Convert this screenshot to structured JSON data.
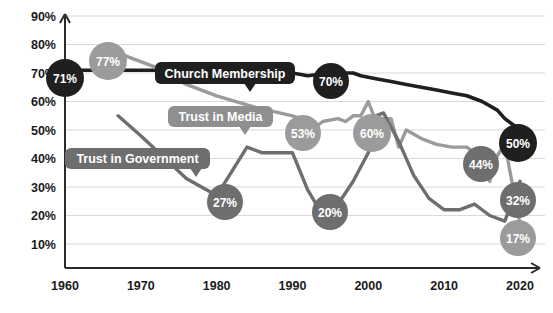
{
  "chart_data": {
    "type": "line",
    "title": "",
    "subtitle": "",
    "xlabel": "",
    "ylabel": "",
    "xlim": [
      1960,
      2020
    ],
    "ylim": [
      0,
      90
    ],
    "grid": true,
    "legend_position": "inline-callouts",
    "y_ticks": [
      "10%",
      "20%",
      "30%",
      "40%",
      "50%",
      "60%",
      "70%",
      "80%",
      "90%"
    ],
    "y_tick_values": [
      10,
      20,
      30,
      40,
      50,
      60,
      70,
      80,
      90
    ],
    "x_ticks": [
      "1960",
      "1970",
      "1980",
      "1990",
      "2000",
      "2010",
      "2020"
    ],
    "x_tick_values": [
      1960,
      1970,
      1980,
      1990,
      2000,
      2010,
      2020
    ],
    "series": [
      {
        "name": "Church Membership",
        "color": "#1f1f1f",
        "stroke_width": 3.6,
        "x": [
          1960,
          1965,
          1968,
          1972,
          1976,
          1980,
          1984,
          1987,
          1990,
          1992,
          1995,
          1998,
          1999,
          2001,
          2003,
          2005,
          2007,
          2009,
          2011,
          2013,
          2015,
          2017,
          2018,
          2020
        ],
        "values": [
          71,
          71,
          71,
          71,
          70,
          70,
          69,
          68,
          70,
          69,
          70,
          70,
          69,
          68,
          67,
          66,
          65,
          64,
          63,
          62,
          60,
          57,
          54,
          50
        ]
      },
      {
        "name": "Trust in Media",
        "color": "#9b9b9b",
        "stroke_width": 3.4,
        "x": [
          1967,
          1972,
          1974,
          1976,
          1980,
          1985,
          1990,
          1992,
          1993,
          1994,
          1996,
          1997,
          1998,
          1999,
          2000,
          2001,
          2002,
          2003,
          2004,
          2005,
          2007,
          2009,
          2011,
          2013,
          2015,
          2016,
          2017,
          2018,
          2020
        ],
        "values": [
          77,
          72,
          69,
          66,
          62,
          58,
          55,
          53,
          51,
          53,
          54,
          53,
          55,
          55,
          60,
          53,
          54,
          54,
          44,
          50,
          47,
          45,
          44,
          44,
          40,
          32,
          41,
          45,
          17
        ]
      },
      {
        "name": "Trust in Government",
        "color": "#6e6e6e",
        "stroke_width": 3.4,
        "x": [
          1967,
          1970,
          1974,
          1976,
          1980,
          1984,
          1986,
          1990,
          1992,
          1994,
          1996,
          1998,
          2000,
          2001,
          2002,
          2004,
          2006,
          2008,
          2010,
          2012,
          2014,
          2016,
          2018,
          2020
        ],
        "values": [
          55,
          48,
          38,
          33,
          27,
          44,
          42,
          42,
          29,
          20,
          24,
          32,
          42,
          55,
          56,
          46,
          34,
          26,
          22,
          22,
          24,
          20,
          18,
          32
        ]
      }
    ],
    "callouts": [
      {
        "label": "Church Membership",
        "bg": "#1f1f1f",
        "fg": "#ffffff",
        "x": 155,
        "y": 62,
        "w": 140,
        "h": 22,
        "tail_x": 250,
        "tail_dir": "down"
      },
      {
        "label": "Trust in Media",
        "bg": "#8f8f8f",
        "fg": "#ffffff",
        "x": 168,
        "y": 106,
        "w": 105,
        "h": 21,
        "tail_x": 245,
        "tail_dir": "down"
      },
      {
        "label": "Trust in Government",
        "bg": "#6e6e6e",
        "fg": "#ffffff",
        "x": 65,
        "y": 148,
        "w": 145,
        "h": 21,
        "tail_x": 196,
        "tail_dir": "down"
      }
    ],
    "markers": [
      {
        "label": "71%",
        "series": "Church Membership",
        "year": 1960,
        "value": 71,
        "cx": 65,
        "cy": 78,
        "r": 19,
        "color": "#1f1f1f"
      },
      {
        "label": "77%",
        "series": "Trust in Media",
        "year": 1967,
        "value": 77,
        "cx": 108,
        "cy": 61,
        "r": 19,
        "color": "#9b9b9b"
      },
      {
        "label": "70%",
        "series": "Church Membership",
        "year": 1995,
        "value": 70,
        "cx": 331,
        "cy": 81,
        "r": 18,
        "color": "#1f1f1f"
      },
      {
        "label": "50%",
        "series": "Church Membership",
        "year": 2020,
        "value": 50,
        "cx": 518,
        "cy": 143,
        "r": 19,
        "color": "#1f1f1f"
      },
      {
        "label": "53%",
        "series": "Trust in Media",
        "year": 1992,
        "value": 53,
        "cx": 303,
        "cy": 133,
        "r": 18,
        "color": "#9b9b9b"
      },
      {
        "label": "60%",
        "series": "Trust in Media",
        "year": 2000,
        "value": 60,
        "cx": 372,
        "cy": 133,
        "r": 19,
        "color": "#9b9b9b"
      },
      {
        "label": "17%",
        "series": "Trust in Media",
        "year": 2020,
        "value": 17,
        "cx": 518,
        "cy": 238,
        "r": 18,
        "color": "#9b9b9b"
      },
      {
        "label": "27%",
        "series": "Trust in Government",
        "year": 1980,
        "value": 27,
        "cx": 225,
        "cy": 202,
        "r": 18,
        "color": "#6e6e6e"
      },
      {
        "label": "20%",
        "series": "Trust in Government",
        "year": 1994,
        "value": 20,
        "cx": 330,
        "cy": 212,
        "r": 18,
        "color": "#6e6e6e"
      },
      {
        "label": "44%",
        "series": "Trust in Government",
        "year": 2014,
        "value": 44,
        "cx": 481,
        "cy": 164,
        "r": 18,
        "color": "#6e6e6e"
      },
      {
        "label": "32%",
        "series": "Trust in Government",
        "year": 2020,
        "value": 32,
        "cx": 518,
        "cy": 200,
        "r": 18,
        "color": "#6e6e6e"
      }
    ]
  }
}
